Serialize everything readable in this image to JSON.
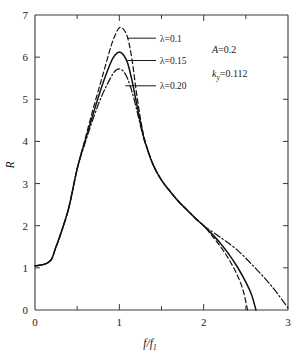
{
  "chart_data": {
    "type": "line",
    "title": "",
    "xlabel": "f/f1",
    "xlabel_parts": {
      "num": "f",
      "denom": "f",
      "denom_sub": "1"
    },
    "ylabel": "R",
    "xlim": [
      0,
      3
    ],
    "ylim": [
      0,
      7
    ],
    "xticks": [
      0,
      1,
      2,
      3
    ],
    "xtick_labels": [
      "0",
      "1",
      "2",
      "3"
    ],
    "xminor_ticks": [
      0.5,
      1.5,
      2.5
    ],
    "yticks": [
      0,
      1,
      2,
      3,
      4,
      5,
      6,
      7
    ],
    "ytick_labels": [
      "0",
      "1",
      "2",
      "3",
      "4",
      "5",
      "6",
      "7"
    ],
    "grid": false,
    "legend_position": "inside-upper-left-with-leader-lines",
    "series": [
      {
        "name": "lambda=0.1",
        "label": "λ=0.1",
        "linestyle": "dashed",
        "color": "#111111",
        "peak_x": 1.0,
        "peak_y": 6.7,
        "end_x": 2.52,
        "points": [
          [
            0.0,
            1.05
          ],
          [
            0.05,
            1.06
          ],
          [
            0.1,
            1.08
          ],
          [
            0.15,
            1.12
          ],
          [
            0.2,
            1.22
          ],
          [
            0.24,
            1.45
          ],
          [
            0.3,
            1.78
          ],
          [
            0.4,
            2.42
          ],
          [
            0.5,
            3.35
          ],
          [
            0.6,
            4.1
          ],
          [
            0.7,
            4.85
          ],
          [
            0.8,
            5.55
          ],
          [
            0.9,
            6.25
          ],
          [
            0.95,
            6.52
          ],
          [
            1.0,
            6.7
          ],
          [
            1.05,
            6.66
          ],
          [
            1.1,
            6.45
          ],
          [
            1.15,
            5.95
          ],
          [
            1.2,
            5.2
          ],
          [
            1.25,
            4.55
          ],
          [
            1.3,
            4.05
          ],
          [
            1.4,
            3.45
          ],
          [
            1.5,
            3.08
          ],
          [
            1.6,
            2.82
          ],
          [
            1.7,
            2.58
          ],
          [
            1.8,
            2.38
          ],
          [
            1.9,
            2.18
          ],
          [
            2.0,
            2.0
          ],
          [
            2.1,
            1.76
          ],
          [
            2.2,
            1.5
          ],
          [
            2.3,
            1.2
          ],
          [
            2.4,
            0.82
          ],
          [
            2.47,
            0.45
          ],
          [
            2.52,
            0.0
          ]
        ]
      },
      {
        "name": "lambda=0.15",
        "label": "λ=0.15",
        "linestyle": "solid",
        "color": "#111111",
        "peak_x": 1.0,
        "peak_y": 6.12,
        "end_x": 2.62,
        "points": [
          [
            0.0,
            1.05
          ],
          [
            0.05,
            1.06
          ],
          [
            0.1,
            1.08
          ],
          [
            0.15,
            1.12
          ],
          [
            0.2,
            1.22
          ],
          [
            0.24,
            1.45
          ],
          [
            0.3,
            1.78
          ],
          [
            0.4,
            2.42
          ],
          [
            0.5,
            3.35
          ],
          [
            0.6,
            4.05
          ],
          [
            0.7,
            4.72
          ],
          [
            0.8,
            5.35
          ],
          [
            0.9,
            5.88
          ],
          [
            0.95,
            6.05
          ],
          [
            1.0,
            6.12
          ],
          [
            1.05,
            6.05
          ],
          [
            1.1,
            5.85
          ],
          [
            1.15,
            5.45
          ],
          [
            1.2,
            4.95
          ],
          [
            1.25,
            4.45
          ],
          [
            1.3,
            4.02
          ],
          [
            1.4,
            3.45
          ],
          [
            1.5,
            3.08
          ],
          [
            1.6,
            2.82
          ],
          [
            1.7,
            2.58
          ],
          [
            1.8,
            2.38
          ],
          [
            1.9,
            2.18
          ],
          [
            2.0,
            2.0
          ],
          [
            2.1,
            1.8
          ],
          [
            2.2,
            1.58
          ],
          [
            2.3,
            1.32
          ],
          [
            2.4,
            1.02
          ],
          [
            2.5,
            0.66
          ],
          [
            2.57,
            0.35
          ],
          [
            2.62,
            0.0
          ]
        ]
      },
      {
        "name": "lambda=0.20",
        "label": "λ=0.20",
        "linestyle": "dashdot",
        "color": "#111111",
        "peak_x": 1.0,
        "peak_y": 5.72,
        "end_x": 3.0,
        "points": [
          [
            0.0,
            1.05
          ],
          [
            0.05,
            1.06
          ],
          [
            0.1,
            1.08
          ],
          [
            0.15,
            1.12
          ],
          [
            0.2,
            1.22
          ],
          [
            0.24,
            1.45
          ],
          [
            0.3,
            1.78
          ],
          [
            0.4,
            2.42
          ],
          [
            0.5,
            3.35
          ],
          [
            0.6,
            4.0
          ],
          [
            0.7,
            4.6
          ],
          [
            0.8,
            5.12
          ],
          [
            0.9,
            5.52
          ],
          [
            0.95,
            5.67
          ],
          [
            1.0,
            5.72
          ],
          [
            1.05,
            5.66
          ],
          [
            1.1,
            5.48
          ],
          [
            1.15,
            5.18
          ],
          [
            1.2,
            4.8
          ],
          [
            1.25,
            4.38
          ],
          [
            1.3,
            4.0
          ],
          [
            1.4,
            3.45
          ],
          [
            1.5,
            3.08
          ],
          [
            1.6,
            2.82
          ],
          [
            1.7,
            2.58
          ],
          [
            1.8,
            2.38
          ],
          [
            1.9,
            2.18
          ],
          [
            2.0,
            2.0
          ],
          [
            2.1,
            1.86
          ],
          [
            2.2,
            1.72
          ],
          [
            2.4,
            1.42
          ],
          [
            2.6,
            1.02
          ],
          [
            2.8,
            0.58
          ],
          [
            3.0,
            0.05
          ]
        ]
      }
    ],
    "annotations": [
      {
        "name": "amplitude",
        "base": "A",
        "value": "=0.2"
      },
      {
        "name": "stiffness",
        "base": "k",
        "sub": "y",
        "value": "=0.112"
      }
    ],
    "leader_lines": [
      {
        "series": "lambda=0.1",
        "anchor_x": 1.1,
        "anchor_y": 6.45,
        "label_x": 1.47,
        "label_y": 6.45
      },
      {
        "series": "lambda=0.15",
        "anchor_x": 1.08,
        "anchor_y": 5.92,
        "label_x": 1.47,
        "label_y": 5.92
      },
      {
        "series": "lambda=0.20",
        "anchor_x": 1.07,
        "anchor_y": 5.32,
        "label_x": 1.47,
        "label_y": 5.32
      }
    ]
  }
}
